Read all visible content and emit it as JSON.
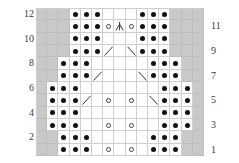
{
  "chart_data": {
    "type": "table",
    "columns": 15,
    "rows": 12,
    "xlabel": "",
    "ylabel": "",
    "legend_position": "none",
    "grid": true,
    "colors": {
      "no_stitch": "#c9c9c9",
      "stitch_bg": "#ffffff",
      "gridline": "#cfcfcf",
      "symbol": "#111111",
      "label": "#3a3a3a"
    },
    "symbol_key": {
      "dot": "purl",
      "ring": "yarn-over",
      "diag-right": "left-leaning-decrease",
      "diag-left": "right-leaning-decrease",
      "center-double-dec": "central-double-decrease",
      "grey": "no-stitch",
      "blank": "knit"
    },
    "row_labels_left": [
      "12",
      "10",
      "8",
      "6",
      "4",
      "2"
    ],
    "row_labels_right": [
      "11",
      "9",
      "7",
      "5",
      "3",
      "1"
    ],
    "row_label_left_rows": [
      12,
      10,
      8,
      6,
      4,
      2
    ],
    "row_label_right_rows": [
      11,
      9,
      7,
      5,
      3,
      1
    ],
    "cells": [
      [
        "grey",
        "grey",
        "grey",
        "dot",
        "dot",
        "dot",
        "blank",
        "blank",
        "blank",
        "dot",
        "dot",
        "dot",
        "grey",
        "grey",
        "grey"
      ],
      [
        "grey",
        "grey",
        "grey",
        "dot",
        "dot",
        "dot",
        "ring",
        "center-double-dec",
        "ring",
        "dot",
        "dot",
        "dot",
        "grey",
        "grey",
        "grey"
      ],
      [
        "grey",
        "grey",
        "grey",
        "dot",
        "dot",
        "dot",
        "blank",
        "blank",
        "blank",
        "dot",
        "dot",
        "dot",
        "grey",
        "grey",
        "grey"
      ],
      [
        "grey",
        "grey",
        "grey",
        "dot",
        "dot",
        "dot",
        "diag-right",
        "blank",
        "diag-left",
        "dot",
        "dot",
        "dot",
        "grey",
        "grey",
        "grey"
      ],
      [
        "grey",
        "grey",
        "dot",
        "dot",
        "dot",
        "blank",
        "blank",
        "blank",
        "blank",
        "blank",
        "dot",
        "dot",
        "dot",
        "grey",
        "grey"
      ],
      [
        "grey",
        "grey",
        "dot",
        "dot",
        "dot",
        "diag-right",
        "blank",
        "blank",
        "blank",
        "diag-left",
        "dot",
        "dot",
        "dot",
        "grey",
        "grey"
      ],
      [
        "grey",
        "dot",
        "dot",
        "dot",
        "blank",
        "blank",
        "blank",
        "blank",
        "blank",
        "blank",
        "blank",
        "dot",
        "dot",
        "dot",
        "grey"
      ],
      [
        "grey",
        "dot",
        "dot",
        "dot",
        "diag-right",
        "blank",
        "ring",
        "blank",
        "ring",
        "blank",
        "diag-left",
        "dot",
        "dot",
        "dot",
        "grey"
      ],
      [
        "grey",
        "dot",
        "dot",
        "dot",
        "blank",
        "blank",
        "blank",
        "blank",
        "blank",
        "blank",
        "blank",
        "dot",
        "dot",
        "dot",
        "grey"
      ],
      [
        "grey",
        "dot",
        "dot",
        "dot",
        "blank",
        "blank",
        "ring",
        "blank",
        "ring",
        "blank",
        "blank",
        "dot",
        "dot",
        "dot",
        "grey"
      ],
      [
        "grey",
        "grey",
        "dot",
        "dot",
        "dot",
        "blank",
        "blank",
        "blank",
        "blank",
        "blank",
        "dot",
        "dot",
        "dot",
        "grey",
        "grey"
      ],
      [
        "grey",
        "grey",
        "dot",
        "dot",
        "dot",
        "blank",
        "ring",
        "blank",
        "ring",
        "blank",
        "dot",
        "dot",
        "dot",
        "grey",
        "grey"
      ]
    ]
  }
}
